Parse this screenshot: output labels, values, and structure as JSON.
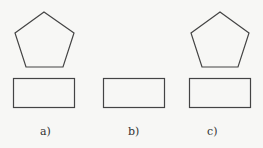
{
  "figure": {
    "panels": [
      {
        "label": "a)",
        "has_pentagon": true,
        "has_rectangle": true
      },
      {
        "label": "b)",
        "has_pentagon": false,
        "has_rectangle": true
      },
      {
        "label": "c)",
        "has_pentagon": true,
        "has_rectangle": true
      }
    ],
    "stroke_color": "#444444",
    "background": "#f7f7f5"
  }
}
